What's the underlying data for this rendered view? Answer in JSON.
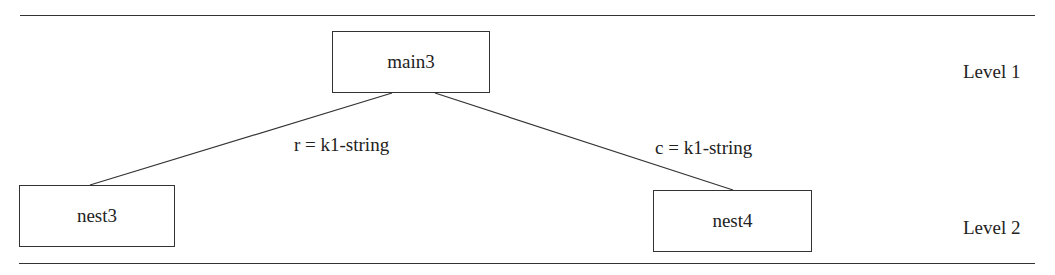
{
  "diagram": {
    "nodes": [
      {
        "id": "main3",
        "label": "main3",
        "level": 1
      },
      {
        "id": "nest3",
        "label": "nest3",
        "level": 2
      },
      {
        "id": "nest4",
        "label": "nest4",
        "level": 2
      }
    ],
    "edges": [
      {
        "from": "main3",
        "to": "nest3",
        "label": "r = k1-string"
      },
      {
        "from": "main3",
        "to": "nest4",
        "label": "c = k1-string"
      }
    ],
    "levels": [
      {
        "label": "Level 1"
      },
      {
        "label": "Level 2"
      }
    ]
  }
}
